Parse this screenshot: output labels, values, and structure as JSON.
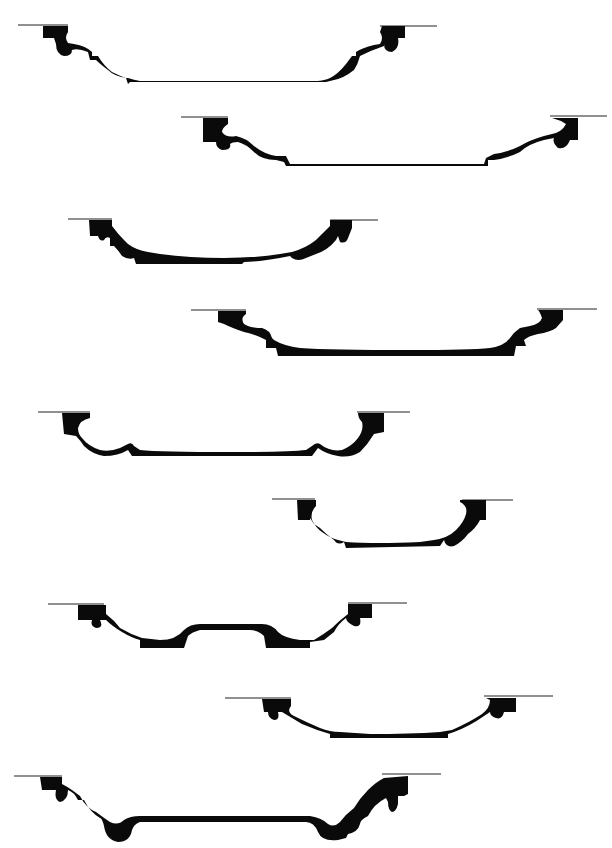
{
  "figure": {
    "background": "#ffffff",
    "ink": "#0a0a0a",
    "profiles": [
      {
        "id": 1,
        "line_y": 25,
        "left_line": [
          18,
          60
        ],
        "right_line": [
          380,
          437
        ],
        "base_y": 82
      },
      {
        "id": 2,
        "line_y": 117,
        "left_line": [
          181,
          228
        ],
        "right_line": [
          550,
          607
        ],
        "base_y": 163
      },
      {
        "id": 3,
        "line_y": 219,
        "left_line": [
          68,
          112
        ],
        "right_line": [
          330,
          378
        ],
        "base_y": 263
      },
      {
        "id": 4,
        "line_y": 310,
        "left_line": [
          191,
          246
        ],
        "right_line": [
          537,
          597
        ],
        "base_y": 354
      },
      {
        "id": 5,
        "line_y": 411,
        "left_line": [
          38,
          90
        ],
        "right_line": [
          357,
          410
        ],
        "base_y": 456
      },
      {
        "id": 6,
        "line_y": 499,
        "left_line": [
          272,
          315
        ],
        "right_line": [
          462,
          513
        ],
        "base_y": 547
      },
      {
        "id": 7,
        "line_y": 604,
        "left_line": [
          48,
          104
        ],
        "right_line": [
          348,
          407
        ],
        "base_y": 644
      },
      {
        "id": 8,
        "line_y": 697,
        "left_line": [
          225,
          291
        ],
        "right_line": [
          484,
          553
        ],
        "base_y": 738
      },
      {
        "id": 9,
        "line_y": 775,
        "left_line": [
          14,
          62
        ],
        "right_line": [
          382,
          441
        ],
        "base_y": 835
      }
    ]
  }
}
